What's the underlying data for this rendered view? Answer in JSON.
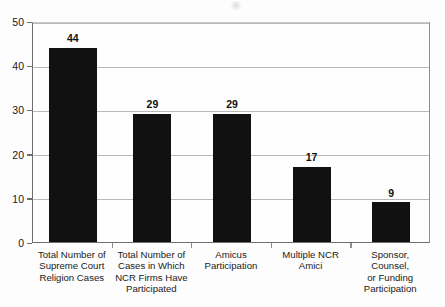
{
  "chart_data": {
    "type": "bar",
    "title": "",
    "xlabel": "",
    "ylabel": "",
    "ylim": [
      0,
      50
    ],
    "yticks": [
      0,
      10,
      20,
      30,
      40,
      50
    ],
    "grid": true,
    "legend": "none",
    "orientation": "vertical",
    "bar_color": "#111111",
    "grid_color": "#b9b9b9",
    "axis_color": "#6e6e6e",
    "categories": [
      "Total Number of Supreme Court Religion Cases",
      "Total Number of Cases in Which NCR Firms Have Participated",
      "Amicus Participation",
      "Multiple NCR Amici",
      "Sponsor, Counsel, or Funding Participation"
    ],
    "values": [
      44,
      29,
      29,
      17,
      9
    ],
    "bars": [
      {
        "label_lines": [
          "Total Number of",
          "Supreme Court",
          "Religion Cases"
        ],
        "value": 44,
        "value_label": "44"
      },
      {
        "label_lines": [
          "Total Number of",
          "Cases in Which",
          "NCR Firms Have",
          "Participated"
        ],
        "value": 29,
        "value_label": "29"
      },
      {
        "label_lines": [
          "Amicus",
          "Participation"
        ],
        "value": 29,
        "value_label": "29"
      },
      {
        "label_lines": [
          "Multiple NCR",
          "Amici"
        ],
        "value": 17,
        "value_label": "17"
      },
      {
        "label_lines": [
          "Sponsor, Counsel,",
          "or Funding",
          "Participation"
        ],
        "value": 9,
        "value_label": "9"
      }
    ],
    "ytick_labels": [
      "0",
      "10",
      "20",
      "30",
      "40",
      "50"
    ]
  }
}
